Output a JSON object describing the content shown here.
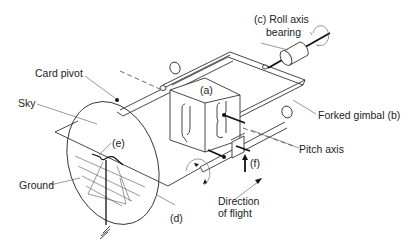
{
  "diagram": {
    "type": "artificial-horizon-gyro-schematic",
    "labels": {
      "roll_axis_bearing_line1": "(c) Roll axis",
      "roll_axis_bearing_line2": "bearing",
      "card_pivot": "Card pivot",
      "rotor_case": "(a)",
      "sky": "Sky",
      "forked_gimbal": "Forked gimbal (b)",
      "horizon_bar": "(e)",
      "pitch_axis": "Pitch axis",
      "pendulous_vane": "(f)",
      "ground": "Ground",
      "card": "(d)",
      "direction_line1": "Direction",
      "direction_line2": "of flight"
    },
    "colors": {
      "line": "#333333",
      "text": "#222222",
      "background": "#ffffff"
    }
  }
}
